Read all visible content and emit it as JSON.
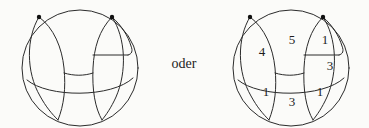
{
  "figure": {
    "background_color": "#fbfbf9",
    "ink_color": "#2b2b2b",
    "conjunction": {
      "text": "oder",
      "x": 184,
      "y": 64
    },
    "left_diagram": {
      "name": "unlabeled-planar-graph",
      "center_x": 80,
      "center_y": 68,
      "radius": 58,
      "vertices": [
        {
          "id": "v-left",
          "x": 39,
          "y": 17
        },
        {
          "id": "v-right",
          "x": 112,
          "y": 17
        }
      ],
      "face_labels": []
    },
    "right_diagram": {
      "name": "labeled-planar-graph",
      "center_x": 291,
      "center_y": 68,
      "radius": 58,
      "vertices": [
        {
          "id": "v-left",
          "x": 250,
          "y": 17
        },
        {
          "id": "v-right",
          "x": 323,
          "y": 17
        }
      ],
      "face_labels": [
        {
          "id": "face-left",
          "value": "4",
          "x": 262,
          "y": 53
        },
        {
          "id": "face-center-top",
          "value": "5",
          "x": 292,
          "y": 41
        },
        {
          "id": "face-right-top",
          "value": "1",
          "x": 325,
          "y": 41
        },
        {
          "id": "face-right-middle",
          "value": "3",
          "x": 330,
          "y": 67
        },
        {
          "id": "face-bottom-left",
          "value": "1",
          "x": 266,
          "y": 93
        },
        {
          "id": "face-bottom-center",
          "value": "3",
          "x": 292,
          "y": 103
        },
        {
          "id": "face-bottom-right",
          "value": "1",
          "x": 320,
          "y": 93
        }
      ]
    }
  }
}
